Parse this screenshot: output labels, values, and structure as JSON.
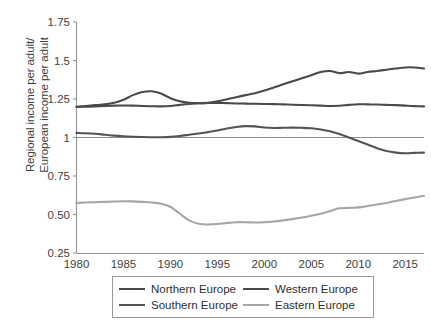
{
  "chart_data": {
    "type": "line",
    "title": "",
    "xlabel": "",
    "ylabel": "Regional income per adult/ European income per adult",
    "ylabel_line1": "Regional income per adult/",
    "ylabel_line2": "European income per adult",
    "xlim": [
      1980,
      2017
    ],
    "ylim": [
      0.25,
      1.75
    ],
    "grid": false,
    "reference_line_y": 1,
    "legend_position": "bottom",
    "yticks": [
      "1.75",
      "1.5",
      "1.25",
      "1",
      "0.75",
      "0.50",
      "0.25"
    ],
    "ytick_values": [
      1.75,
      1.5,
      1.25,
      1,
      0.75,
      0.5,
      0.25
    ],
    "xticks": [
      "1980",
      "1985",
      "1990",
      "1995",
      "2000",
      "2005",
      "2010",
      "2015"
    ],
    "xtick_values": [
      1980,
      1985,
      1990,
      1995,
      2000,
      2005,
      2010,
      2015
    ],
    "x": [
      1980,
      1981,
      1982,
      1983,
      1984,
      1985,
      1986,
      1987,
      1988,
      1989,
      1990,
      1991,
      1992,
      1993,
      1994,
      1995,
      1996,
      1997,
      1998,
      1999,
      2000,
      2001,
      2002,
      2003,
      2004,
      2005,
      2006,
      2007,
      2008,
      2009,
      2010,
      2011,
      2012,
      2013,
      2014,
      2015,
      2016,
      2017
    ],
    "series": [
      {
        "name": "Northern Europe",
        "color": "#4a4a4a",
        "values": [
          1.2,
          1.205,
          1.21,
          1.215,
          1.225,
          1.245,
          1.275,
          1.295,
          1.3,
          1.285,
          1.255,
          1.235,
          1.225,
          1.222,
          1.225,
          1.235,
          1.248,
          1.262,
          1.275,
          1.288,
          1.305,
          1.325,
          1.345,
          1.365,
          1.385,
          1.405,
          1.425,
          1.432,
          1.418,
          1.425,
          1.415,
          1.425,
          1.432,
          1.44,
          1.448,
          1.455,
          1.455,
          1.448
        ]
      },
      {
        "name": "Western Europe",
        "color": "#4a4a4a",
        "values": [
          1.198,
          1.2,
          1.202,
          1.205,
          1.207,
          1.208,
          1.207,
          1.205,
          1.203,
          1.202,
          1.205,
          1.212,
          1.218,
          1.222,
          1.224,
          1.225,
          1.223,
          1.221,
          1.22,
          1.219,
          1.218,
          1.217,
          1.215,
          1.213,
          1.211,
          1.209,
          1.207,
          1.205,
          1.206,
          1.212,
          1.216,
          1.215,
          1.214,
          1.212,
          1.21,
          1.207,
          1.204,
          1.202
        ]
      },
      {
        "name": "Southern Europe",
        "color": "#555555",
        "values": [
          1.03,
          1.028,
          1.024,
          1.018,
          1.012,
          1.008,
          1.005,
          1.003,
          1.002,
          1.002,
          1.004,
          1.01,
          1.018,
          1.026,
          1.035,
          1.045,
          1.058,
          1.068,
          1.074,
          1.072,
          1.065,
          1.062,
          1.063,
          1.064,
          1.063,
          1.06,
          1.052,
          1.04,
          1.022,
          1.0,
          0.978,
          0.955,
          0.93,
          0.912,
          0.902,
          0.898,
          0.9,
          0.902
        ]
      },
      {
        "name": "Eastern Europe",
        "color": "#a6a6a6",
        "values": [
          0.575,
          0.578,
          0.58,
          0.582,
          0.584,
          0.586,
          0.585,
          0.582,
          0.578,
          0.57,
          0.55,
          0.505,
          0.462,
          0.44,
          0.435,
          0.438,
          0.445,
          0.45,
          0.45,
          0.448,
          0.45,
          0.455,
          0.462,
          0.47,
          0.48,
          0.492,
          0.505,
          0.522,
          0.54,
          0.543,
          0.546,
          0.555,
          0.565,
          0.575,
          0.588,
          0.6,
          0.61,
          0.622
        ]
      }
    ],
    "legend": [
      {
        "label": "Northern Europe",
        "color": "#4a4a4a"
      },
      {
        "label": "Western Europe",
        "color": "#4a4a4a"
      },
      {
        "label": "Southern Europe",
        "color": "#555555"
      },
      {
        "label": "Eastern Europe",
        "color": "#a6a6a6"
      }
    ]
  }
}
